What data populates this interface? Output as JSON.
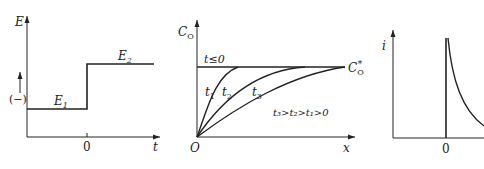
{
  "panel_a": {
    "y_axis": "E",
    "x_axis": "t",
    "origin_tick": "0",
    "sign_label": "(−)",
    "level_low": {
      "base": "E",
      "sub": "1"
    },
    "level_high": {
      "base": "E",
      "sub": "2"
    }
  },
  "panel_b": {
    "y_axis": {
      "base": "C",
      "sub": "O"
    },
    "x_axis": "x",
    "origin": "O",
    "initial_label": "t≤0",
    "bulk_label": {
      "base": "C",
      "sub": "O",
      "sup": "*"
    },
    "curves": [
      {
        "base": "t",
        "sub": "1"
      },
      {
        "base": "t",
        "sub": "2"
      },
      {
        "base": "t",
        "sub": "3"
      }
    ],
    "relation": "t₃>t₂>t₁>0"
  },
  "panel_c": {
    "y_axis": "i",
    "origin_tick": "0"
  }
}
